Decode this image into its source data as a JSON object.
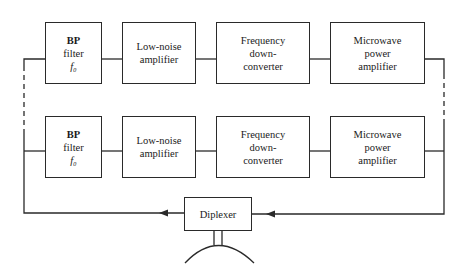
{
  "diagram": {
    "rows": [
      {
        "id": "upper",
        "blocks": [
          {
            "name": "bp-filter-upper",
            "lines": [
              "BP",
              "filter",
              "f₀"
            ]
          },
          {
            "name": "low-noise-amplifier-upper",
            "lines": [
              "Low-noise",
              "amplifier"
            ]
          },
          {
            "name": "frequency-downconverter-upper",
            "lines": [
              "Frequency",
              "down-",
              "converter"
            ]
          },
          {
            "name": "microwave-power-amplifier-upper",
            "lines": [
              "Microwave",
              "power",
              "amplifier"
            ]
          }
        ]
      },
      {
        "id": "lower",
        "blocks": [
          {
            "name": "bp-filter-lower",
            "lines": [
              "BP",
              "filter",
              "f₀"
            ]
          },
          {
            "name": "low-noise-amplifier-lower",
            "lines": [
              "Low-noise",
              "amplifier"
            ]
          },
          {
            "name": "frequency-downconverter-lower",
            "lines": [
              "Frequency",
              "down-",
              "converter"
            ]
          },
          {
            "name": "microwave-power-amplifier-lower",
            "lines": [
              "Microwave",
              "power",
              "amplifier"
            ]
          }
        ]
      }
    ],
    "diplexer": {
      "label": "Diplexer"
    },
    "antenna": {
      "icon": "dish-antenna-icon"
    },
    "colors": {
      "line": "#2a2a2a",
      "background": "#ffffff",
      "text": "#1a1a1a"
    }
  }
}
